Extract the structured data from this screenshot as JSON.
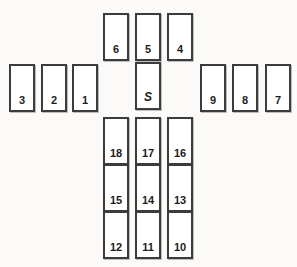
{
  "board": {
    "name": "card-spread-diagram",
    "width": 297,
    "height": 267,
    "background_color": "#fbfaf8",
    "card_border_color": "#3c3c3c",
    "card_fill_color": "#ffffff",
    "label_color": "#1c1c1c"
  },
  "card_size": {
    "width": 26,
    "height": 48
  },
  "groups": [
    {
      "name": "top-row",
      "cards": [
        {
          "label": "6",
          "x": 103,
          "y": 13,
          "w": 26,
          "h": 48
        },
        {
          "label": "5",
          "x": 135,
          "y": 13,
          "w": 26,
          "h": 48
        },
        {
          "label": "4",
          "x": 167,
          "y": 13,
          "w": 26,
          "h": 48
        }
      ]
    },
    {
      "name": "left-row",
      "cards": [
        {
          "label": "3",
          "x": 9,
          "y": 64,
          "w": 26,
          "h": 48
        },
        {
          "label": "2",
          "x": 41,
          "y": 64,
          "w": 26,
          "h": 48
        },
        {
          "label": "1",
          "x": 72,
          "y": 64,
          "w": 26,
          "h": 48
        }
      ]
    },
    {
      "name": "significator",
      "cards": [
        {
          "label": "S",
          "x": 135,
          "y": 62,
          "w": 26,
          "h": 48
        }
      ]
    },
    {
      "name": "right-row",
      "cards": [
        {
          "label": "9",
          "x": 200,
          "y": 64,
          "w": 26,
          "h": 48
        },
        {
          "label": "8",
          "x": 232,
          "y": 64,
          "w": 26,
          "h": 48
        },
        {
          "label": "7",
          "x": 265,
          "y": 64,
          "w": 26,
          "h": 48
        }
      ]
    },
    {
      "name": "bottom-grid-row-1",
      "cards": [
        {
          "label": "18",
          "x": 103,
          "y": 117,
          "w": 26,
          "h": 48
        },
        {
          "label": "17",
          "x": 135,
          "y": 117,
          "w": 26,
          "h": 48
        },
        {
          "label": "16",
          "x": 167,
          "y": 117,
          "w": 26,
          "h": 48
        }
      ]
    },
    {
      "name": "bottom-grid-row-2",
      "cards": [
        {
          "label": "15",
          "x": 103,
          "y": 164,
          "w": 26,
          "h": 48
        },
        {
          "label": "14",
          "x": 135,
          "y": 164,
          "w": 26,
          "h": 48
        },
        {
          "label": "13",
          "x": 167,
          "y": 164,
          "w": 26,
          "h": 48
        }
      ]
    },
    {
      "name": "bottom-grid-row-3",
      "cards": [
        {
          "label": "12",
          "x": 103,
          "y": 211,
          "w": 26,
          "h": 48
        },
        {
          "label": "11",
          "x": 135,
          "y": 211,
          "w": 26,
          "h": 48
        },
        {
          "label": "10",
          "x": 167,
          "y": 211,
          "w": 26,
          "h": 48
        }
      ]
    }
  ]
}
